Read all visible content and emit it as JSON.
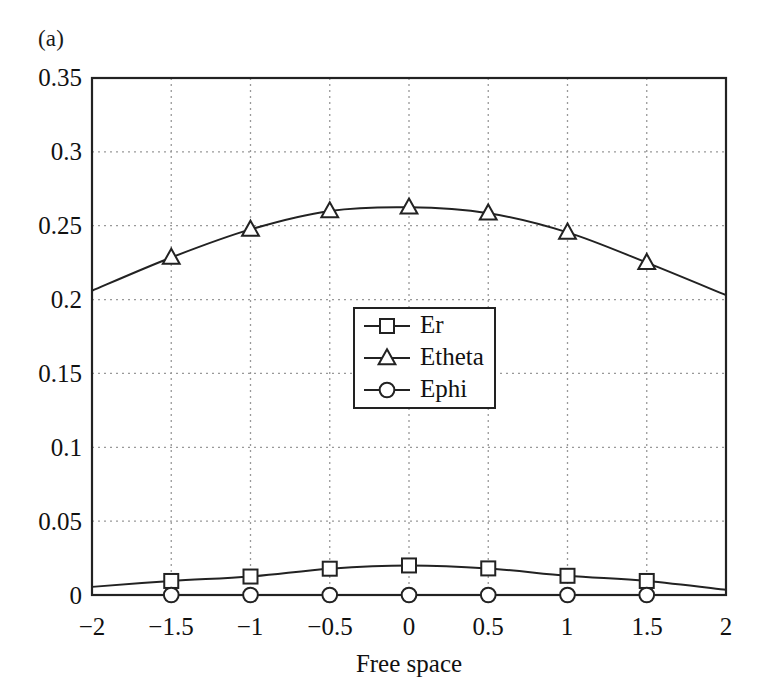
{
  "figure": {
    "panel_label": "(a)",
    "background": "#ffffff",
    "line_color": "#222222",
    "grid_color": "#999999"
  },
  "chart_data": {
    "type": "line",
    "title": "",
    "xlabel": "Free space",
    "ylabel": "",
    "xlim": [
      -2,
      2
    ],
    "ylim": [
      0,
      0.35
    ],
    "xticks": [
      -2,
      -1.5,
      -1,
      -0.5,
      0,
      0.5,
      1,
      1.5,
      2
    ],
    "xticklabels": [
      "−2",
      "−1.5",
      "−1",
      "−0.5",
      "0",
      "0.5",
      "1",
      "1.5",
      "2"
    ],
    "yticks": [
      0,
      0.05,
      0.1,
      0.15,
      0.2,
      0.25,
      0.3,
      0.35
    ],
    "yticklabels": [
      "0",
      "0.05",
      "0.1",
      "0.15",
      "0.2",
      "0.25",
      "0.3",
      "0.35"
    ],
    "grid": true,
    "grid_style": "dotted",
    "legend_position": "center",
    "x": [
      -2,
      -1.5,
      -1,
      -0.5,
      0,
      0.5,
      1,
      1.5,
      2
    ],
    "marker_x": [
      -1.5,
      -1,
      -0.5,
      0,
      0.5,
      1,
      1.5
    ],
    "series": [
      {
        "name": "Er",
        "marker": "square",
        "values": [
          0.0055,
          0.0095,
          0.0125,
          0.0178,
          0.02,
          0.018,
          0.013,
          0.0095,
          0.0035
        ]
      },
      {
        "name": "Etheta",
        "marker": "triangle",
        "values": [
          0.206,
          0.2285,
          0.2475,
          0.26,
          0.2625,
          0.2585,
          0.2455,
          0.225,
          0.203
        ]
      },
      {
        "name": "Ephi",
        "marker": "circle",
        "values": [
          0.0,
          0.0,
          0.0,
          0.0,
          0.0,
          0.0,
          0.0,
          0.0,
          0.0
        ]
      }
    ],
    "legend": [
      {
        "label": "Er",
        "marker": "square"
      },
      {
        "label": "Etheta",
        "marker": "triangle"
      },
      {
        "label": "Ephi",
        "marker": "circle"
      }
    ]
  }
}
